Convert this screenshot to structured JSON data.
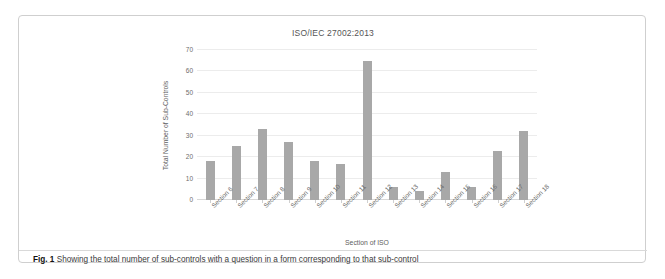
{
  "figure": {
    "caption_label": "Fig. 1",
    "caption_text": "Showing the total number of sub-controls with a question in a form corresponding to that sub-control"
  },
  "chart_data": {
    "type": "bar",
    "title": "ISO/IEC 27002:2013",
    "xlabel": "Section of ISO",
    "ylabel": "Total Number of Sub-Controls",
    "categories": [
      "Section 6",
      "Section 7",
      "Section 8",
      "Section 9",
      "Section 10",
      "Section 11",
      "Section 12",
      "Section 13",
      "Section 14",
      "Section 15",
      "Section 16",
      "Section 17",
      "Section 18"
    ],
    "values": [
      18,
      25,
      33,
      27,
      18,
      17,
      65,
      6,
      4,
      13,
      6,
      23,
      32
    ],
    "ylim": [
      0,
      70
    ],
    "yticks": [
      0,
      10,
      20,
      30,
      40,
      50,
      60,
      70
    ],
    "ytick_labels": [
      "0",
      "10",
      "20",
      "30",
      "40",
      "50",
      "60",
      "70"
    ],
    "grid": true,
    "legend": "none",
    "bar_color": "#a8a8a8",
    "gridline_color": "#ececec"
  }
}
